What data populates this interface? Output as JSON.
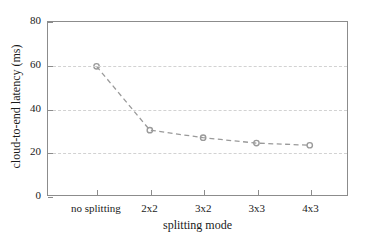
{
  "chart_data": {
    "type": "line",
    "title": "",
    "subtitle": "",
    "xlabel": "splitting mode",
    "ylabel": "cloud-to-end latency (ms)",
    "categories": [
      "no splitting",
      "2x2",
      "3x2",
      "3x3",
      "4x3"
    ],
    "series": [
      {
        "name": "cloud-to-end latency",
        "values": [
          59.5,
          30.0,
          26.5,
          24.0,
          23.0
        ],
        "color": "#9a9a9a",
        "linestyle": "dashed",
        "marker": "circle"
      }
    ],
    "ylim": [
      0,
      80
    ],
    "yticks": [
      0,
      20,
      40,
      60,
      80
    ],
    "ytick_labels": [
      "0",
      "20",
      "40",
      "60",
      "80"
    ],
    "xtick_labels": [
      "no splitting",
      "2x2",
      "3x2",
      "3x3",
      "4x3"
    ],
    "gridlines_y": [
      20,
      40,
      60
    ],
    "grid": true,
    "grid_color": "#d2d2d2",
    "legend": null,
    "legend_position": "none",
    "axis_color": "#8c8c8c",
    "background": "#ffffff",
    "annotations": []
  }
}
